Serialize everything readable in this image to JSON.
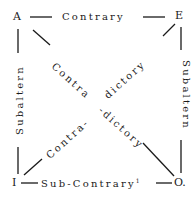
{
  "diagram": {
    "corners": {
      "top_left": "A",
      "top_right": "E",
      "bottom_left": "I",
      "bottom_right": "O."
    },
    "edges": {
      "top": "Contrary",
      "bottom": "Sub-Contrary",
      "bottom_footnote": "1",
      "left": "Subaltern",
      "right": "Subaltern",
      "diagonal_a_o_part1": "Contra",
      "diagonal_a_o_part2": "-dictory",
      "diagonal_i_e_part1": "Contra-",
      "diagonal_i_e_part2": "dictory"
    },
    "colors": {
      "ink": "#1a1a1a",
      "background": "#ffffff"
    }
  }
}
